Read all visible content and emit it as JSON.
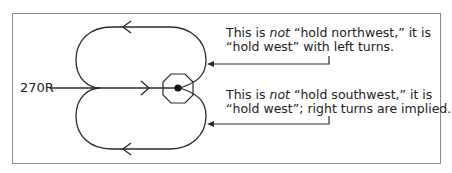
{
  "diagram": {
    "type": "holding-pattern",
    "inbound_label": "270R",
    "notes": [
      {
        "line1_a": "This is ",
        "line1_em": "not",
        "line1_b": " “hold northwest,” it is",
        "line2": "“hold west” with left turns."
      },
      {
        "line1_a": "This is ",
        "line1_em": "not",
        "line1_b": " “hold southwest,” it is",
        "line2": "“hold west”; right turns are implied."
      }
    ],
    "colors": {
      "line": "#2a2a2a",
      "frame": "#8a8a8a",
      "text": "#222222"
    }
  }
}
